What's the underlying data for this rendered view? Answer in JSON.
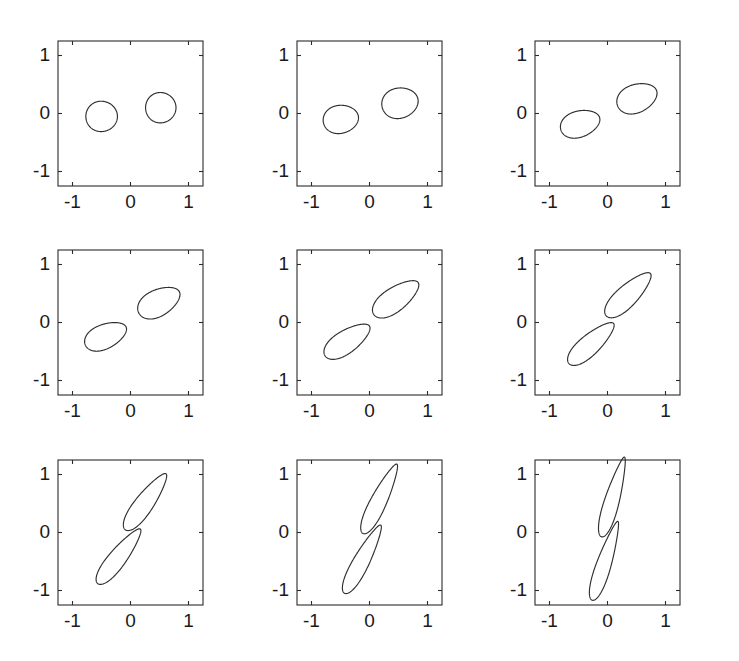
{
  "figure": {
    "type": "multi-panel-curve-grid",
    "rows": 3,
    "cols": 3,
    "background": "#ffffff",
    "line_color": "#2f2f2f",
    "axis_color": "#2b2b2b"
  },
  "chart_data": {
    "type": "line",
    "title": "",
    "xlabel": "",
    "ylabel": "",
    "xlim": [
      -1.25,
      1.25
    ],
    "ylim": [
      -1.25,
      1.25
    ],
    "grid": false,
    "legend": "none",
    "xticks": [
      -1,
      0,
      1
    ],
    "yticks": [
      -1,
      0,
      1
    ],
    "xticklabels": [
      "-1",
      "0",
      "1"
    ],
    "yticklabels": [
      "-1",
      "0",
      "1"
    ],
    "panels": [
      {
        "index": 1,
        "row": 0,
        "col": 0,
        "lobe_angle_deg": 0,
        "lobe_length": 0.28,
        "lobe_width": 0.28,
        "separation": 0.52,
        "overlap": 0.0,
        "series": [
          {
            "name": "lower-left-lobe",
            "center": [
              -0.5,
              -0.05
            ],
            "rx": 0.27,
            "ry": 0.27,
            "rot_deg": 0
          },
          {
            "name": "upper-right-lobe",
            "center": [
              0.52,
              0.1
            ],
            "rx": 0.26,
            "ry": 0.27,
            "rot_deg": 0
          }
        ]
      },
      {
        "index": 2,
        "row": 0,
        "col": 1,
        "lobe_angle_deg": 12,
        "lobe_length": 0.33,
        "lobe_width": 0.27,
        "separation": 0.56,
        "overlap": 0.0,
        "series": [
          {
            "name": "lower-left-lobe",
            "center": [
              -0.5,
              -0.1
            ],
            "rx": 0.3,
            "ry": 0.26,
            "rot_deg": 10
          },
          {
            "name": "upper-right-lobe",
            "center": [
              0.52,
              0.18
            ],
            "rx": 0.31,
            "ry": 0.28,
            "rot_deg": 14
          }
        ]
      },
      {
        "index": 3,
        "row": 0,
        "col": 2,
        "lobe_angle_deg": 22,
        "lobe_length": 0.38,
        "lobe_width": 0.27,
        "separation": 0.62,
        "overlap": 0.0,
        "series": [
          {
            "name": "lower-left-lobe",
            "center": [
              -0.48,
              -0.18
            ],
            "rx": 0.34,
            "ry": 0.25,
            "rot_deg": 18
          },
          {
            "name": "upper-right-lobe",
            "center": [
              0.5,
              0.26
            ],
            "rx": 0.35,
            "ry": 0.27,
            "rot_deg": 22
          }
        ]
      },
      {
        "index": 4,
        "row": 1,
        "col": 0,
        "lobe_angle_deg": 30,
        "lobe_length": 0.42,
        "lobe_width": 0.26,
        "separation": 0.66,
        "overlap": 0.02,
        "series": [
          {
            "name": "lower-left-lobe",
            "center": [
              -0.44,
              -0.24
            ],
            "rx": 0.37,
            "ry": 0.24,
            "rot_deg": 24
          },
          {
            "name": "upper-right-lobe",
            "center": [
              0.48,
              0.34
            ],
            "rx": 0.38,
            "ry": 0.26,
            "rot_deg": 28
          }
        ]
      },
      {
        "index": 5,
        "row": 1,
        "col": 1,
        "lobe_angle_deg": 38,
        "lobe_length": 0.5,
        "lobe_width": 0.24,
        "separation": 0.7,
        "overlap": 0.05,
        "series": [
          {
            "name": "lower-left-lobe",
            "center": [
              -0.4,
              -0.33
            ],
            "rx": 0.44,
            "ry": 0.23,
            "rot_deg": 34
          },
          {
            "name": "upper-right-lobe",
            "center": [
              0.44,
              0.4
            ],
            "rx": 0.45,
            "ry": 0.24,
            "rot_deg": 36
          }
        ]
      },
      {
        "index": 6,
        "row": 1,
        "col": 2,
        "lobe_angle_deg": 46,
        "lobe_length": 0.56,
        "lobe_width": 0.22,
        "separation": 0.72,
        "overlap": 0.1,
        "series": [
          {
            "name": "lower-left-lobe",
            "center": [
              -0.3,
              -0.38
            ],
            "rx": 0.49,
            "ry": 0.21,
            "rot_deg": 42
          },
          {
            "name": "upper-right-lobe",
            "center": [
              0.34,
              0.46
            ],
            "rx": 0.5,
            "ry": 0.22,
            "rot_deg": 44
          }
        ]
      },
      {
        "index": 7,
        "row": 2,
        "col": 0,
        "lobe_angle_deg": 56,
        "lobe_length": 0.64,
        "lobe_width": 0.2,
        "separation": 0.74,
        "overlap": 0.18,
        "series": [
          {
            "name": "lower-left-lobe",
            "center": [
              -0.22,
              -0.44
            ],
            "rx": 0.56,
            "ry": 0.19,
            "rot_deg": 52
          },
          {
            "name": "upper-right-lobe",
            "center": [
              0.24,
              0.5
            ],
            "rx": 0.56,
            "ry": 0.2,
            "rot_deg": 54
          }
        ]
      },
      {
        "index": 8,
        "row": 2,
        "col": 1,
        "lobe_angle_deg": 64,
        "lobe_length": 0.7,
        "lobe_width": 0.18,
        "separation": 0.76,
        "overlap": 0.28,
        "series": [
          {
            "name": "lower-left-lobe",
            "center": [
              -0.14,
              -0.5
            ],
            "rx": 0.62,
            "ry": 0.18,
            "rot_deg": 62
          },
          {
            "name": "upper-right-lobe",
            "center": [
              0.16,
              0.54
            ],
            "rx": 0.62,
            "ry": 0.18,
            "rot_deg": 64
          }
        ]
      },
      {
        "index": 9,
        "row": 2,
        "col": 2,
        "lobe_angle_deg": 74,
        "lobe_length": 0.74,
        "lobe_width": 0.17,
        "separation": 0.78,
        "overlap": 0.38,
        "series": [
          {
            "name": "lower-left-lobe",
            "center": [
              -0.06,
              -0.54
            ],
            "rx": 0.66,
            "ry": 0.17,
            "rot_deg": 72
          },
          {
            "name": "upper-right-lobe",
            "center": [
              0.08,
              0.56
            ],
            "rx": 0.66,
            "ry": 0.17,
            "rot_deg": 74
          }
        ]
      }
    ]
  }
}
